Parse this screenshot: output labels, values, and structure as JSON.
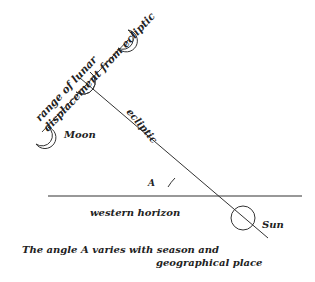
{
  "diagram": {
    "labels": {
      "range_line1": "range of lunar",
      "range_line2": "displacement from ecliptic",
      "moon": "Moon",
      "ecliptic": "ecliptic",
      "angle": "A",
      "horizon": "western horizon",
      "sun": "Sun",
      "caption_line1": "The angle A varies with season and",
      "caption_line2": "geographical place"
    },
    "colors": {
      "line": "#333333",
      "text": "#222222",
      "background": "#ffffff"
    }
  }
}
